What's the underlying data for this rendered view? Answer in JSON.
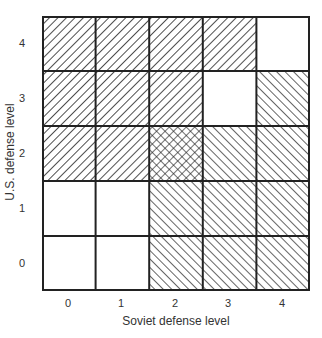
{
  "chart_data": {
    "type": "heatmap",
    "title": "",
    "xlabel": "Soviet defense level",
    "ylabel": "U.S. defense level",
    "x_ticks": [
      "0",
      "1",
      "2",
      "3",
      "4"
    ],
    "y_ticks": [
      "0",
      "1",
      "2",
      "3",
      "4"
    ],
    "legend": {
      "back": "backslash hatching (lines top-left to bottom-right)",
      "fwd": "forward-slash hatching (lines bottom-left to top-right)",
      "cross": "crosshatching",
      "blank": "no hatching"
    },
    "cells_by_row_top_to_bottom": [
      {
        "us_level": 4,
        "pattern": [
          "back",
          "back",
          "back",
          "back",
          "blank"
        ]
      },
      {
        "us_level": 3,
        "pattern": [
          "back",
          "back",
          "back",
          "blank",
          "fwd"
        ]
      },
      {
        "us_level": 2,
        "pattern": [
          "back",
          "back",
          "cross",
          "fwd",
          "fwd"
        ]
      },
      {
        "us_level": 1,
        "pattern": [
          "blank",
          "blank",
          "fwd",
          "fwd",
          "fwd"
        ]
      },
      {
        "us_level": 0,
        "pattern": [
          "blank",
          "blank",
          "fwd",
          "fwd",
          "fwd"
        ]
      }
    ]
  },
  "axes": {
    "x_label": "Soviet defense level",
    "y_label": "U.S. defense level",
    "x_ticks": [
      "0",
      "1",
      "2",
      "3",
      "4"
    ],
    "y_ticks": [
      "4",
      "3",
      "2",
      "1",
      "0"
    ]
  },
  "colors": {
    "line": "#222222",
    "background": "#ffffff"
  }
}
